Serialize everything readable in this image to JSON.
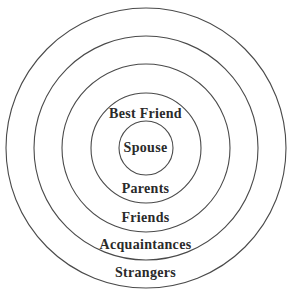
{
  "diagram": {
    "type": "concentric-circles",
    "center": [
      146,
      148
    ],
    "rings": [
      {
        "name": "strangers-ring",
        "radius": 140
      },
      {
        "name": "acquaintances-ring",
        "radius": 112
      },
      {
        "name": "friends-ring",
        "radius": 84
      },
      {
        "name": "parents-ring",
        "radius": 55
      },
      {
        "name": "spouse-ring",
        "radius": 27
      }
    ],
    "stroke_color": "#4a4a4a",
    "labels": {
      "best_friend": "Best Friend",
      "spouse": "Spouse",
      "parents": "Parents",
      "friends": "Friends",
      "acquaintances": "Acquaintances",
      "strangers": "Strangers"
    }
  }
}
